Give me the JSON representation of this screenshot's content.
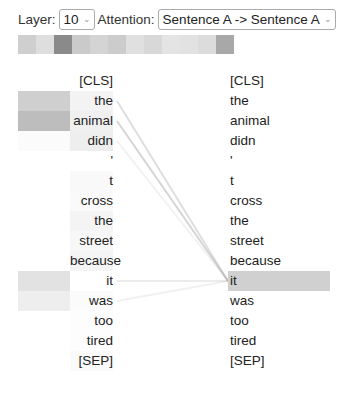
{
  "controls": {
    "layer_label": "Layer:",
    "layer_value": "10",
    "attention_label": "Attention:",
    "attention_value": "Sentence A -> Sentence A"
  },
  "head_colors": [
    "#cfcfcf",
    "#dedede",
    "#8a8a8a",
    "#cacaca",
    "#d4d4d4",
    "#cccccc",
    "#e0e0e0",
    "#d8d8d8",
    "#e4e4e4",
    "#e2e2e2",
    "#dcdcdc",
    "#a8a8a8"
  ],
  "tokens_left": [
    "[CLS]",
    "the",
    "animal",
    "didn",
    "'",
    "t",
    "cross",
    "the",
    "street",
    "because",
    "it",
    "was",
    "too",
    "tired",
    "[SEP]"
  ],
  "tokens_right": [
    "[CLS]",
    "the",
    "animal",
    "didn",
    "'",
    "t",
    "cross",
    "the",
    "street",
    "because",
    "it",
    "was",
    "too",
    "tired",
    "[SEP]"
  ],
  "left_heat": [
    "#ffffff",
    "#cfcfcf",
    "#bdbdbd",
    "#fbfbfb",
    "#ffffff",
    "#ffffff",
    "#ffffff",
    "#ffffff",
    "#ffffff",
    "#ffffff",
    "#e2e2e2",
    "#eeeeee",
    "#ffffff",
    "#ffffff",
    "#ffffff"
  ],
  "left_token_bg": [
    "#ffffff",
    "#f3f3f3",
    "#f0f0f0",
    "#eeeeee",
    "#ffffff",
    "#f9f9f9",
    "#fafafa",
    "#f4f4f4",
    "#f7f7f7",
    "#f4f4f4",
    "#ffffff",
    "#fbfbfb",
    "#fdfdfd",
    "#fdfdfd",
    "#fafafa"
  ],
  "selected_right_index": 10,
  "selected_highlight": "#d0d0d0",
  "attention_lines": [
    {
      "from": 1,
      "to": 10,
      "opacity": 0.35
    },
    {
      "from": 2,
      "to": 10,
      "opacity": 0.45
    },
    {
      "from": 3,
      "to": 10,
      "opacity": 0.15
    },
    {
      "from": 10,
      "to": 10,
      "opacity": 0.2
    },
    {
      "from": 11,
      "to": 10,
      "opacity": 0.15
    }
  ]
}
